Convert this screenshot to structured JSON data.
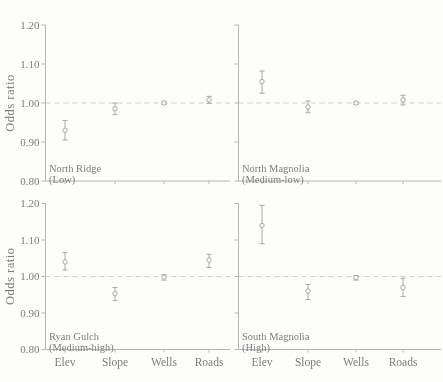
{
  "figure": {
    "background": "#fdfdfb",
    "axis_color": "#b5b5b5",
    "dash_color": "#c8c8c8",
    "marker_color": "#a0a0a0",
    "text_color": "#7e7e7e"
  },
  "chart_data": {
    "type": "scatter",
    "subtype": "odds-ratio-errorbar-panels",
    "title": "",
    "ylabel": "Odds ratio",
    "xlabel": "",
    "ylim": [
      0.8,
      1.2
    ],
    "yticks": [
      1.2,
      1.1,
      1.0,
      0.9,
      0.8
    ],
    "ytick_labels": [
      "1.20",
      "1.10",
      "1.00",
      "0.90",
      "0.80"
    ],
    "reference_line": 1.0,
    "grid": false,
    "legend": "none",
    "categories": [
      "Elev",
      "Slope",
      "Wells",
      "Roads"
    ],
    "panels": [
      {
        "site": "North Ridge",
        "level": "(Low)",
        "position": "top-left",
        "points": [
          {
            "cat": "Elev",
            "value": 0.93,
            "lo": 0.905,
            "hi": 0.955
          },
          {
            "cat": "Slope",
            "value": 0.985,
            "lo": 0.97,
            "hi": 1.0
          },
          {
            "cat": "Wells",
            "value": 1.0,
            "lo": 0.997,
            "hi": 1.003
          },
          {
            "cat": "Roads",
            "value": 1.008,
            "lo": 0.999,
            "hi": 1.017
          }
        ]
      },
      {
        "site": "North Magnolia",
        "level": "(Medium-low)",
        "position": "top-right",
        "points": [
          {
            "cat": "Elev",
            "value": 1.055,
            "lo": 1.025,
            "hi": 1.082
          },
          {
            "cat": "Slope",
            "value": 0.99,
            "lo": 0.975,
            "hi": 1.005
          },
          {
            "cat": "Wells",
            "value": 1.0,
            "lo": 0.997,
            "hi": 1.003
          },
          {
            "cat": "Roads",
            "value": 1.008,
            "lo": 0.995,
            "hi": 1.02
          }
        ]
      },
      {
        "site": "Ryan Gulch",
        "level": "(Medium-high)",
        "position": "bottom-left",
        "points": [
          {
            "cat": "Elev",
            "value": 1.04,
            "lo": 1.018,
            "hi": 1.066
          },
          {
            "cat": "Slope",
            "value": 0.953,
            "lo": 0.934,
            "hi": 0.97
          },
          {
            "cat": "Wells",
            "value": 0.998,
            "lo": 0.99,
            "hi": 1.005
          },
          {
            "cat": "Roads",
            "value": 1.045,
            "lo": 1.025,
            "hi": 1.061
          }
        ]
      },
      {
        "site": "South Magnolia",
        "level": "(High)",
        "position": "bottom-right",
        "points": [
          {
            "cat": "Elev",
            "value": 1.14,
            "lo": 1.09,
            "hi": 1.195
          },
          {
            "cat": "Slope",
            "value": 0.96,
            "lo": 0.937,
            "hi": 0.978
          },
          {
            "cat": "Wells",
            "value": 0.997,
            "lo": 0.99,
            "hi": 1.003
          },
          {
            "cat": "Roads",
            "value": 0.97,
            "lo": 0.945,
            "hi": 0.995
          }
        ]
      }
    ]
  }
}
